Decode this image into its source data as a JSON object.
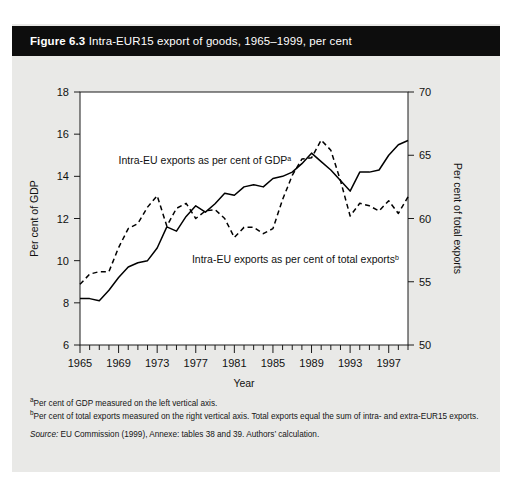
{
  "figure": {
    "number": "Figure 6.3",
    "title": "Intra-EUR15 export of goods, 1965–1999, per cent"
  },
  "notes": {
    "a_marker": "a",
    "a_text": "Per cent of GDP measured on the left vertical axis.",
    "b_marker": "b",
    "b_text": "Per cent of total exports measured on the right vertical axis. Total exports equal the sum of intra- and extra-EUR15 exports.",
    "source_label": "Source:",
    "source_text": "EU Commission (1999), Annexe: tables 38 and 39. Authors’ calculation."
  },
  "chart_data": {
    "type": "line",
    "title": "Intra-EUR15 export of goods, 1965–1999, per cent",
    "xlabel": "Year",
    "ylabel": "Per cent of GDP",
    "y2label": "Per cent of total exports",
    "xlim": [
      1965,
      1999
    ],
    "ylim": [
      6,
      18
    ],
    "y2lim": [
      50,
      70
    ],
    "yticks": [
      6,
      8,
      10,
      12,
      14,
      16,
      18
    ],
    "y2ticks": [
      50,
      55,
      60,
      65,
      70
    ],
    "xticks": [
      1965,
      1969,
      1973,
      1977,
      1981,
      1985,
      1989,
      1993,
      1997
    ],
    "xtick_minor_step": 1,
    "grid": false,
    "legend": "in-plot annotations",
    "annotations": [
      {
        "text": "Intra-EU exports as per cent of GDP",
        "sup": "a",
        "x": 1969.0,
        "y": 14.6
      },
      {
        "text": "Intra-EU exports as per cent of total exports",
        "sup": "b",
        "x": 1976.6,
        "y": 9.9
      }
    ],
    "x": [
      1965,
      1966,
      1967,
      1968,
      1969,
      1970,
      1971,
      1972,
      1973,
      1974,
      1975,
      1976,
      1977,
      1978,
      1979,
      1980,
      1981,
      1982,
      1983,
      1984,
      1985,
      1986,
      1987,
      1988,
      1989,
      1990,
      1991,
      1992,
      1993,
      1994,
      1995,
      1996,
      1997,
      1998,
      1999
    ],
    "series": [
      {
        "name": "Intra-EU exports as per cent of GDP",
        "axis": "left",
        "style": "solid",
        "color": "#000000",
        "values": [
          8.2,
          8.2,
          8.1,
          8.6,
          9.2,
          9.7,
          9.9,
          10.0,
          10.6,
          11.6,
          11.4,
          12.1,
          12.6,
          12.3,
          12.7,
          13.2,
          13.1,
          13.5,
          13.6,
          13.5,
          13.9,
          14.0,
          14.2,
          14.6,
          15.1,
          14.7,
          14.3,
          13.8,
          13.3,
          14.2,
          14.2,
          14.3,
          15.0,
          15.5,
          15.7
        ]
      },
      {
        "name": "Intra-EU exports as per cent of total exports",
        "axis": "right",
        "style": "dashed",
        "color": "#000000",
        "values": [
          54.8,
          55.6,
          55.8,
          55.8,
          57.7,
          59.2,
          59.6,
          60.9,
          61.8,
          59.4,
          60.8,
          61.2,
          60.0,
          60.6,
          60.7,
          60.0,
          58.5,
          59.3,
          59.3,
          58.8,
          59.2,
          61.5,
          63.4,
          64.7,
          64.8,
          66.2,
          65.4,
          63.0,
          60.2,
          61.2,
          61.0,
          60.6,
          61.4,
          60.4,
          61.7
        ]
      }
    ]
  }
}
